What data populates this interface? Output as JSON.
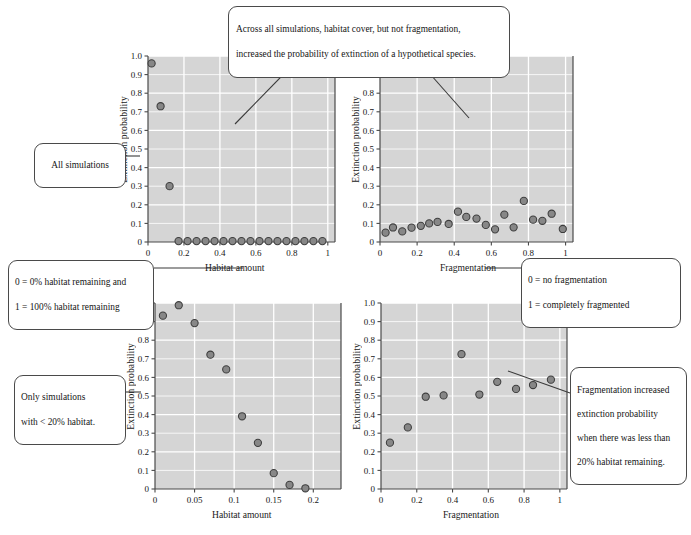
{
  "figure": {
    "background": "#ffffff",
    "panel_bg": "#d5d5d5",
    "grid_color": "#ffffff",
    "marker_fill": "#878787",
    "marker_edge": "#3d3d3d",
    "axis_color": "#4a4a4a"
  },
  "callouts": {
    "main": {
      "line1": "Across all simulations, habitat cover, but not fragmentation,",
      "line2": "increased the probability of extinction of a hypothetical species."
    },
    "all_simulations": {
      "line1": "All simulations"
    },
    "habitat_definition": {
      "line1": "0 = 0% habitat remaining and",
      "line2": "1 = 100% habitat remaining"
    },
    "fragmentation_definition": {
      "line1": "0 = no fragmentation",
      "line2": "1 = completely fragmented"
    },
    "only_simulations": {
      "line1": "Only simulations",
      "line2": "with < 20% habitat."
    },
    "fragmentation_increase": {
      "line1": "Fragmentation increased",
      "line2": "extinction probability",
      "line3": "when there was less than",
      "line4": "20% habitat remaining."
    }
  },
  "chart_data": [
    {
      "id": "top-left",
      "type": "scatter",
      "title": "",
      "xlabel": "Habitat amount",
      "ylabel": "Extinction probability",
      "xlim": [
        0,
        1.04
      ],
      "ylim": [
        0,
        1.0
      ],
      "xticks": [
        0,
        0.2,
        0.4,
        0.6,
        0.8,
        1
      ],
      "xticklabels": [
        "0",
        "0.2",
        "0.4",
        "0.6",
        "0.8",
        "1"
      ],
      "yticks": [
        0,
        0.1,
        0.2,
        0.3,
        0.4,
        0.5,
        0.6,
        0.7,
        0.8,
        0.9,
        1.0
      ],
      "yticklabels": [
        "0",
        "0.1",
        "0.2",
        "0.3",
        "0.4",
        "0.5",
        "0.6",
        "0.7",
        "0.8",
        "0.9",
        "1.0"
      ],
      "grid": true,
      "x": [
        0.02,
        0.07,
        0.12,
        0.17,
        0.22,
        0.27,
        0.32,
        0.37,
        0.42,
        0.47,
        0.52,
        0.57,
        0.62,
        0.67,
        0.72,
        0.77,
        0.82,
        0.87,
        0.92,
        0.97
      ],
      "y": [
        0.96,
        0.73,
        0.3,
        0.005,
        0.005,
        0.005,
        0.005,
        0.005,
        0.005,
        0.005,
        0.005,
        0.005,
        0.005,
        0.005,
        0.005,
        0.005,
        0.005,
        0.005,
        0.005,
        0.005
      ]
    },
    {
      "id": "top-right",
      "type": "scatter",
      "title": "",
      "xlabel": "Fragmentation",
      "ylabel": "Extinction probability",
      "xlim": [
        0,
        1.04
      ],
      "ylim": [
        0,
        1.0
      ],
      "xticks": [
        0,
        0.2,
        0.4,
        0.6,
        0.8,
        1
      ],
      "xticklabels": [
        "0",
        "0.2",
        "0.4",
        "0.6",
        "0.8",
        "1"
      ],
      "yticks": [
        0,
        0.1,
        0.2,
        0.3,
        0.4,
        0.5,
        0.6,
        0.7,
        0.8,
        0.9,
        1.0
      ],
      "yticklabels": [
        "0",
        "0.1",
        "0.2",
        "0.3",
        "0.4",
        "0.5",
        "0.6",
        "0.7",
        "0.8",
        "0.9",
        "1.0"
      ],
      "grid": true,
      "x": [
        0.03,
        0.07,
        0.12,
        0.17,
        0.22,
        0.265,
        0.31,
        0.37,
        0.42,
        0.465,
        0.52,
        0.57,
        0.62,
        0.67,
        0.72,
        0.775,
        0.825,
        0.875,
        0.925,
        0.985
      ],
      "y": [
        0.05,
        0.078,
        0.057,
        0.077,
        0.087,
        0.1,
        0.108,
        0.097,
        0.163,
        0.135,
        0.126,
        0.092,
        0.068,
        0.147,
        0.079,
        0.221,
        0.12,
        0.114,
        0.152,
        0.07
      ]
    },
    {
      "id": "bottom-left",
      "type": "scatter",
      "title": "",
      "xlabel": "Habitat amount",
      "ylabel": "Extinction probability",
      "xlim": [
        0,
        0.235
      ],
      "ylim": [
        0,
        1.0
      ],
      "xticks": [
        0,
        0.05,
        0.1,
        0.15,
        0.2
      ],
      "xticklabels": [
        "0",
        "0.05",
        "0.1",
        "0.15",
        "0.2"
      ],
      "yticks": [
        0,
        0.1,
        0.2,
        0.3,
        0.4,
        0.5,
        0.6,
        0.7,
        0.8,
        0.9,
        1.0
      ],
      "yticklabels": [
        "0",
        "0.1",
        "0.2",
        "0.3",
        "0.4",
        "0.5",
        "0.6",
        "0.7",
        "0.8",
        "0.9",
        "1.0"
      ],
      "grid": true,
      "x": [
        0.01,
        0.03,
        0.05,
        0.07,
        0.09,
        0.11,
        0.13,
        0.15,
        0.17,
        0.19
      ],
      "y": [
        0.932,
        0.988,
        0.892,
        0.722,
        0.643,
        0.391,
        0.248,
        0.085,
        0.022,
        0.004
      ]
    },
    {
      "id": "bottom-right",
      "type": "scatter",
      "title": "",
      "xlabel": "Fragmentation",
      "ylabel": "Extinction probability",
      "xlim": [
        0,
        1.04
      ],
      "ylim": [
        0,
        1.0
      ],
      "xticks": [
        0,
        0.2,
        0.4,
        0.6,
        0.8,
        1
      ],
      "xticklabels": [
        "0",
        "0.2",
        "0.4",
        "0.6",
        "0.8",
        "1"
      ],
      "yticks": [
        0,
        0.1,
        0.2,
        0.3,
        0.4,
        0.5,
        0.6,
        0.7,
        0.8,
        0.9,
        1.0
      ],
      "yticklabels": [
        "0",
        "0.1",
        "0.2",
        "0.3",
        "0.4",
        "0.5",
        "0.6",
        "0.7",
        "0.8",
        "0.9",
        "1.0"
      ],
      "grid": true,
      "x": [
        0.05,
        0.15,
        0.25,
        0.35,
        0.45,
        0.55,
        0.65,
        0.755,
        0.85,
        0.95
      ],
      "y": [
        0.249,
        0.331,
        0.496,
        0.503,
        0.725,
        0.508,
        0.576,
        0.538,
        0.559,
        0.588
      ]
    }
  ]
}
